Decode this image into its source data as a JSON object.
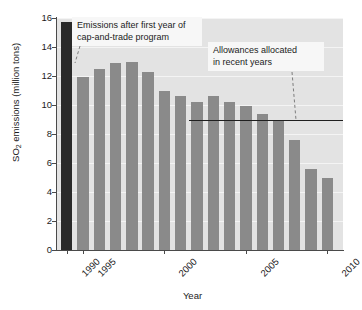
{
  "chart_data": {
    "type": "bar",
    "title": "",
    "xlabel": "Year",
    "ylabel": "SO2 emissions (million tons)",
    "ylabel_parts": {
      "pre": "SO",
      "sub": "2",
      "post": " emissions (million tons)"
    },
    "ylim": [
      0,
      16
    ],
    "ytick_labels": [
      "16",
      "14",
      "12",
      "10",
      "8",
      "6",
      "4",
      "2",
      "0"
    ],
    "ytick_values": [
      16,
      14,
      12,
      10,
      8,
      6,
      4,
      2,
      0
    ],
    "xtick_labels": [
      "1990",
      "1995",
      "2000",
      "2005",
      "2010"
    ],
    "xtick_values": [
      1990,
      1995,
      2000,
      2005,
      2010
    ],
    "grid": "horizontal-white",
    "legend": "none",
    "categories": [
      1990,
      1995,
      1996,
      1997,
      1998,
      1999,
      2000,
      2001,
      2002,
      2003,
      2004,
      2005,
      2006,
      2007,
      2008,
      2009,
      2010
    ],
    "values": [
      15.7,
      11.9,
      12.5,
      12.9,
      13.0,
      12.3,
      11.0,
      10.6,
      10.2,
      10.6,
      10.2,
      9.9,
      9.4,
      8.9,
      7.6,
      5.6,
      5.0
    ],
    "bar_colors": [
      "#2a2a2a",
      "#8a8a8a",
      "#8a8a8a",
      "#8a8a8a",
      "#8a8a8a",
      "#8a8a8a",
      "#8a8a8a",
      "#8a8a8a",
      "#8a8a8a",
      "#8a8a8a",
      "#8a8a8a",
      "#8a8a8a",
      "#8a8a8a",
      "#8a8a8a",
      "#8a8a8a",
      "#8a8a8a",
      "#8a8a8a"
    ],
    "highlight_note": "1990 baseline bar shown in black",
    "reference_line": {
      "label": "Allowances allocated in recent years",
      "value": 9.0,
      "x_start": 2002,
      "x_end": 2011,
      "color": "#1f1f1f"
    },
    "annotations": [
      {
        "id": "anno-cap-and-trade",
        "text": "Emissions after first year of cap-and-trade program",
        "line1": "Emissions after first year of",
        "line2": "cap-and-trade program",
        "points_to": 1995
      },
      {
        "id": "anno-allowances",
        "text": "Allowances allocated in recent years",
        "line1": "Allowances allocated",
        "line2": "in recent years",
        "points_to": 2009
      }
    ],
    "accent_colors": {
      "plot_background": "#e3e3e3",
      "gridline": "#f4f4f4",
      "bar": "#8a8a8a",
      "bar_highlight": "#2a2a2a",
      "axis": "#4a4a4a",
      "annotation_background": "#f7f7f7"
    }
  }
}
